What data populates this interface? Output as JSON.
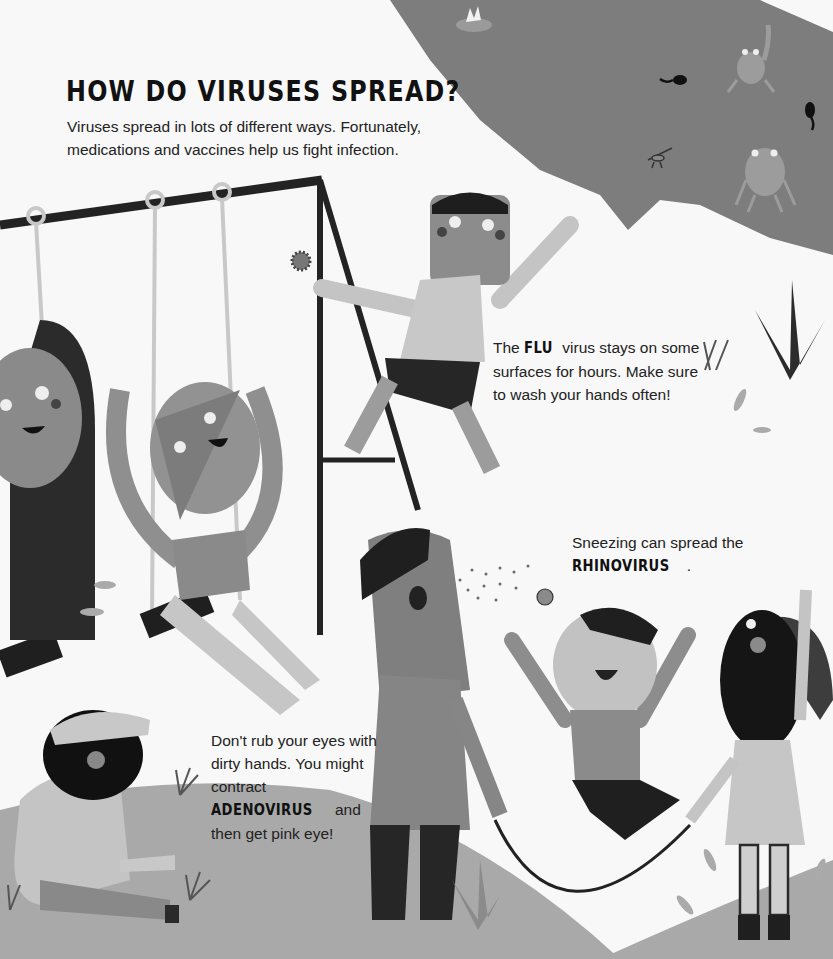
{
  "page": {
    "title": "HOW DO VIRUSES SPREAD?",
    "intro": "Viruses spread in lots of different ways. Fortunately, medications and vaccines help us fight infection."
  },
  "callouts": {
    "flu": {
      "before": "The ",
      "virus": "FLU",
      "after": " virus stays on some surfaces for hours. Make sure to wash your hands often!"
    },
    "rhinovirus": {
      "before": "Sneezing can spread the ",
      "virus": "RHINOVIRUS",
      "after": "."
    },
    "adenovirus": {
      "before": "Don't rub your eyes with dirty hands. You might contract ",
      "virus": "ADENOVIRUS",
      "after": " and then get pink eye!"
    }
  },
  "illustration": {
    "scene": "playground",
    "elements": [
      "pond",
      "frog",
      "tadpole",
      "lily-pad",
      "mosquito",
      "swing-set",
      "virus-particle",
      "sneeze-droplets",
      "jump-rope",
      "grass",
      "leaves"
    ],
    "palette": {
      "background": "#f8f8f8",
      "pond": "#7d7d7d",
      "ground": "#a9a9a9",
      "dark": "#222222",
      "skin_mid": "#8f8f8f",
      "light_gray": "#c4c4c4"
    }
  }
}
